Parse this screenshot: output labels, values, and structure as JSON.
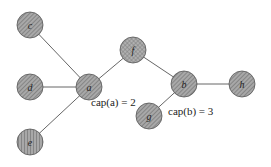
{
  "diagram": {
    "type": "graph",
    "nodes": [
      {
        "id": "c",
        "label": "c",
        "x": 30,
        "y": 25,
        "pattern": "diag"
      },
      {
        "id": "d",
        "label": "d",
        "x": 30,
        "y": 87,
        "pattern": "diag"
      },
      {
        "id": "a",
        "label": "a",
        "x": 89,
        "y": 87,
        "pattern": "diag"
      },
      {
        "id": "f",
        "label": "f",
        "x": 133,
        "y": 50,
        "pattern": "cross"
      },
      {
        "id": "b",
        "label": "b",
        "x": 184,
        "y": 84,
        "pattern": "diag"
      },
      {
        "id": "h",
        "label": "h",
        "x": 242,
        "y": 84,
        "pattern": "diag"
      },
      {
        "id": "g",
        "label": "g",
        "x": 149,
        "y": 116,
        "pattern": "diag"
      },
      {
        "id": "e",
        "label": "e",
        "x": 30,
        "y": 142,
        "pattern": "vert"
      }
    ],
    "edges": [
      [
        "c",
        "a"
      ],
      [
        "d",
        "a"
      ],
      [
        "a",
        "f"
      ],
      [
        "a",
        "e"
      ],
      [
        "f",
        "b"
      ],
      [
        "b",
        "h"
      ],
      [
        "b",
        "g"
      ]
    ],
    "annotations": [
      {
        "id": "cap-a",
        "text": "cap(a) = 2",
        "x": 91,
        "y": 106
      },
      {
        "id": "cap-b",
        "text": "cap(b) = 3",
        "x": 168,
        "y": 115
      }
    ],
    "colors": {
      "node_fill": "#9a9a9a",
      "node_stroke": "#555555",
      "edge": "#555555",
      "hatch": "#6e6e6e"
    },
    "node_radius": 13
  }
}
